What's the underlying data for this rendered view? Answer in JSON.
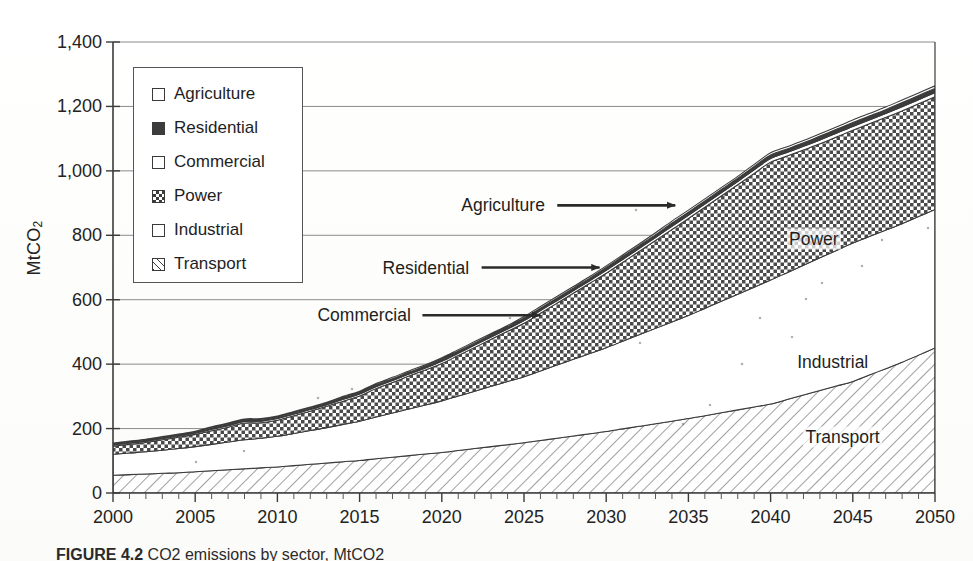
{
  "figure": {
    "caption_label": "FIGURE 4.2",
    "caption_text": "CO2 emissions by sector, MtCO2"
  },
  "axes": {
    "y_title": "MtCO",
    "y_title_sub": "2",
    "y_ticks": [
      "1,400",
      "1,200",
      "1,000",
      "800",
      "600",
      "400",
      "200",
      "0"
    ],
    "y_values": [
      1400,
      1200,
      1000,
      800,
      600,
      400,
      200,
      0
    ],
    "x_ticks": [
      "2000",
      "2005",
      "2010",
      "2015",
      "2020",
      "2025",
      "2030",
      "2035",
      "2040",
      "2045",
      "2050"
    ],
    "x_values": [
      2000,
      2005,
      2010,
      2015,
      2020,
      2025,
      2030,
      2035,
      2040,
      2045,
      2050
    ]
  },
  "legend": {
    "items": [
      {
        "label": "Agriculture",
        "pattern": "white"
      },
      {
        "label": "Residential",
        "pattern": "solid"
      },
      {
        "label": "Commercial",
        "pattern": "white"
      },
      {
        "label": "Power",
        "pattern": "checker"
      },
      {
        "label": "Industrial",
        "pattern": "white"
      },
      {
        "label": "Transport",
        "pattern": "hatch"
      }
    ]
  },
  "annotations": [
    {
      "name": "agriculture",
      "label": "Agriculture",
      "type": "arrow",
      "x": 2034.2,
      "y": 893
    },
    {
      "name": "residential",
      "label": "Residential",
      "type": "arrow",
      "x": 2029.6,
      "y": 700
    },
    {
      "name": "commercial",
      "label": "Commercial",
      "type": "arrow",
      "x": 2026.0,
      "y": 552
    },
    {
      "name": "power",
      "label": "Power",
      "type": "inline",
      "x": 2041.0,
      "y": 787
    },
    {
      "name": "industrial",
      "label": "Industrial",
      "type": "inline",
      "x": 2041.5,
      "y": 407
    },
    {
      "name": "transport",
      "label": "Transport",
      "type": "inline",
      "x": 2042.0,
      "y": 174
    }
  ],
  "chart_data": {
    "type": "area",
    "stacked": true,
    "title": "CO2 emissions by sector",
    "xlabel": "",
    "ylabel": "MtCO2",
    "xlim": [
      2000,
      2050
    ],
    "ylim": [
      0,
      1400
    ],
    "grid": "horizontal",
    "legend_position": "upper-left-inside",
    "x": [
      2000,
      2001,
      2002,
      2003,
      2004,
      2005,
      2006,
      2007,
      2008,
      2009,
      2010,
      2011,
      2012,
      2013,
      2014,
      2015,
      2016,
      2017,
      2018,
      2019,
      2020,
      2021,
      2022,
      2023,
      2024,
      2025,
      2026,
      2027,
      2028,
      2029,
      2030,
      2031,
      2032,
      2033,
      2034,
      2035,
      2036,
      2037,
      2038,
      2039,
      2040,
      2041,
      2042,
      2043,
      2044,
      2045,
      2046,
      2047,
      2048,
      2049,
      2050
    ],
    "series": [
      {
        "name": "Transport",
        "pattern": "hatch",
        "values": [
          55,
          57,
          59,
          61,
          63,
          66,
          69,
          72,
          75,
          78,
          81,
          85,
          89,
          93,
          97,
          101,
          106,
          111,
          116,
          121,
          126,
          132,
          138,
          144,
          150,
          156,
          163,
          170,
          177,
          184,
          191,
          199,
          207,
          215,
          223,
          231,
          240,
          249,
          258,
          267,
          276,
          290,
          304,
          318,
          332,
          346,
          366,
          386,
          406,
          428,
          450
        ]
      },
      {
        "name": "Industrial",
        "pattern": "white",
        "values": [
          65,
          67,
          69,
          72,
          75,
          78,
          82,
          86,
          90,
          92,
          95,
          100,
          105,
          110,
          116,
          122,
          130,
          137,
          145,
          152,
          160,
          169,
          178,
          187,
          196,
          205,
          216,
          227,
          238,
          249,
          260,
          272,
          284,
          296,
          308,
          320,
          333,
          346,
          359,
          372,
          385,
          394,
          403,
          412,
          421,
          430,
          430,
          430,
          430,
          430,
          430
        ]
      },
      {
        "name": "Power",
        "pattern": "checker",
        "values": [
          25,
          27,
          29,
          32,
          35,
          38,
          42,
          46,
          52,
          48,
          50,
          55,
          60,
          66,
          72,
          78,
          88,
          95,
          102,
          109,
          116,
          126,
          136,
          146,
          156,
          166,
          179,
          192,
          205,
          218,
          231,
          245,
          259,
          273,
          287,
          301,
          314,
          327,
          340,
          353,
          366,
          362,
          358,
          354,
          352,
          350,
          350,
          350,
          350,
          350,
          350
        ]
      },
      {
        "name": "Commercial",
        "pattern": "white",
        "values": [
          4,
          4,
          4,
          4,
          4,
          4,
          5,
          5,
          5,
          5,
          5,
          5,
          5,
          5,
          6,
          6,
          6,
          6,
          6,
          6,
          7,
          7,
          7,
          7,
          7,
          8,
          8,
          8,
          8,
          8,
          9,
          9,
          9,
          9,
          10,
          10,
          10,
          10,
          10,
          11,
          11,
          11,
          11,
          12,
          12,
          12,
          12,
          12,
          13,
          13,
          13
        ]
      },
      {
        "name": "Residential",
        "pattern": "solid",
        "values": [
          4,
          4,
          4,
          4,
          4,
          4,
          5,
          5,
          5,
          5,
          5,
          5,
          5,
          5,
          6,
          6,
          6,
          6,
          6,
          6,
          7,
          7,
          7,
          7,
          7,
          8,
          8,
          8,
          8,
          8,
          9,
          9,
          9,
          9,
          10,
          10,
          10,
          10,
          10,
          11,
          11,
          11,
          11,
          12,
          12,
          12,
          12,
          12,
          13,
          13,
          13
        ]
      },
      {
        "name": "Agriculture",
        "pattern": "white",
        "values": [
          2,
          2,
          2,
          2,
          2,
          2,
          3,
          3,
          3,
          3,
          3,
          3,
          3,
          3,
          3,
          3,
          4,
          4,
          4,
          4,
          4,
          4,
          4,
          4,
          4,
          5,
          5,
          5,
          5,
          5,
          5,
          5,
          5,
          6,
          6,
          6,
          6,
          6,
          6,
          6,
          7,
          7,
          7,
          7,
          7,
          8,
          8,
          8,
          8,
          8,
          8
        ]
      }
    ]
  }
}
